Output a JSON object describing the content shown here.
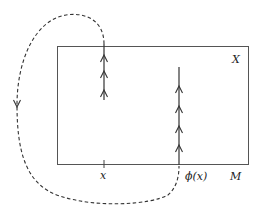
{
  "diagram": {
    "labels": {
      "region_X": "X",
      "base_M": "M",
      "point_x": "x",
      "point_phi_x": "ϕ(x)"
    },
    "colors": {
      "stroke": "#444444",
      "background": "#ffffff"
    },
    "elements": {
      "rectangle": "region X over base M",
      "fiber_left": "vertical fiber over x with upward arrows",
      "fiber_right": "vertical fiber over phi(x) with upward arrows",
      "dashed_path": "dashed curve from top of fiber over x to bottom of fiber over phi(x), with downward arrow on left side"
    }
  }
}
